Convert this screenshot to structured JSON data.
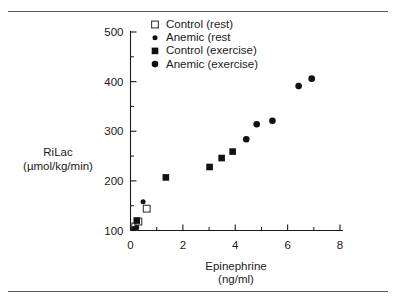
{
  "figure": {
    "name": "rilac-epinephrine-scatter",
    "border": {
      "top_rule": true,
      "bottom_rule": true,
      "color": "#5a5a5a"
    }
  },
  "chart_data": {
    "type": "scatter",
    "title": "",
    "xlabel": "Epinephrine",
    "xunit": "(ng/ml)",
    "ylabel": "RiLac",
    "yunit": "(µmol/kg/min)",
    "xlim": [
      0,
      8
    ],
    "ylim": [
      100,
      500
    ],
    "xticks": [
      0,
      1,
      2,
      3,
      4,
      5,
      6,
      7,
      8
    ],
    "xtick_labels": [
      "0",
      "",
      "2",
      "",
      "4",
      "",
      "6",
      "",
      "8"
    ],
    "yticks": [
      100,
      150,
      200,
      250,
      300,
      350,
      400,
      450,
      500
    ],
    "ytick_labels": [
      "100",
      "",
      "200",
      "",
      "300",
      "",
      "400",
      "",
      "500"
    ],
    "grid": false,
    "legend_position": "top-center",
    "series": [
      {
        "name": "Control (rest)",
        "marker": "open-square",
        "points": [
          {
            "x": 0.18,
            "y": 108
          },
          {
            "x": 0.3,
            "y": 118
          },
          {
            "x": 0.62,
            "y": 144
          }
        ]
      },
      {
        "name": "Anemic (rest",
        "marker": "filled-circle-small",
        "points": [
          {
            "x": 0.12,
            "y": 104
          },
          {
            "x": 0.22,
            "y": 106
          },
          {
            "x": 0.48,
            "y": 158
          }
        ]
      },
      {
        "name": "Control (exercise)",
        "marker": "filled-square",
        "points": [
          {
            "x": 0.24,
            "y": 120
          },
          {
            "x": 1.35,
            "y": 207
          },
          {
            "x": 3.02,
            "y": 228
          },
          {
            "x": 3.48,
            "y": 246
          },
          {
            "x": 3.9,
            "y": 259
          }
        ]
      },
      {
        "name": "Anemic (exercise)",
        "marker": "filled-circle",
        "points": [
          {
            "x": 4.42,
            "y": 284
          },
          {
            "x": 4.82,
            "y": 314
          },
          {
            "x": 5.42,
            "y": 321
          },
          {
            "x": 6.42,
            "y": 391
          },
          {
            "x": 6.92,
            "y": 406
          }
        ]
      }
    ]
  },
  "legend": {
    "items": [
      {
        "label": "Control (rest)",
        "marker": "open-square"
      },
      {
        "label": "Anemic (rest",
        "marker": "filled-circle-small"
      },
      {
        "label": "Control (exercise)",
        "marker": "filled-square"
      },
      {
        "label": "Anemic (exercise)",
        "marker": "filled-circle"
      }
    ]
  }
}
